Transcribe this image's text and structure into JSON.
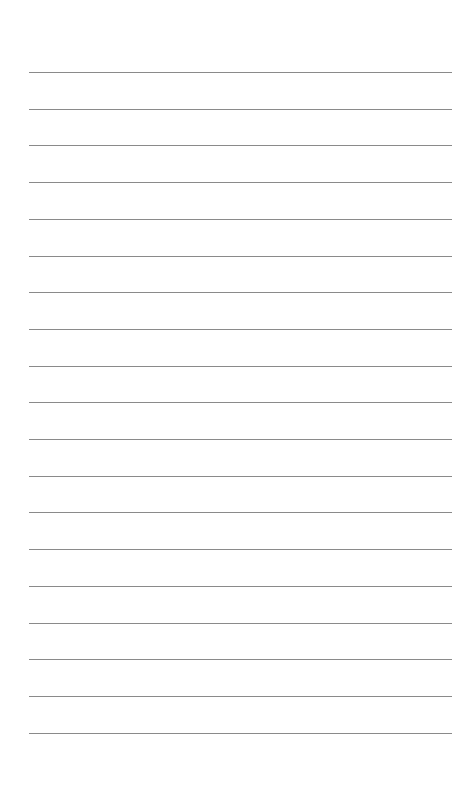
{
  "page": {
    "type": "lined-paper",
    "background": "#ffffff",
    "line_color": "#8a8a8a",
    "line_count": 19,
    "line_left": 29,
    "line_right": 452,
    "first_line_y": 72,
    "line_spacing": 36.7
  }
}
